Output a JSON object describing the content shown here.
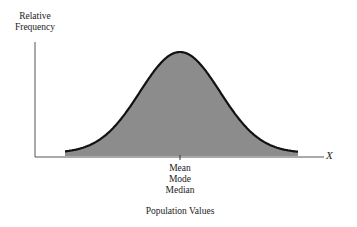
{
  "chart_data": {
    "type": "area",
    "title": "",
    "ylabel": "Relative Frequency",
    "xlabel": "Population Values",
    "x_axis_symbol": "X",
    "center_labels": [
      "Mean",
      "Mode",
      "Median"
    ],
    "grid": false,
    "legend": null,
    "fill_color": "#8c8c8c",
    "curve_color": "#111111"
  },
  "labels": {
    "y_line1": "Relative",
    "y_line2": "Frequency",
    "center_1": "Mean",
    "center_2": "Mode",
    "center_3": "Median",
    "x_title": "Population Values",
    "x_symbol": "X"
  }
}
